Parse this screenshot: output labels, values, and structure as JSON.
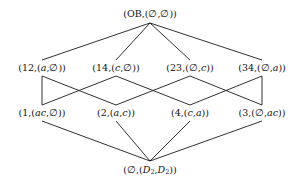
{
  "figure": {
    "type": "hasse-diagram",
    "title": "",
    "background_color": "#ffffff",
    "edge_color": "#1a1a1a",
    "text_color": "#111111",
    "width": 296,
    "height": 184
  },
  "nodes": [
    {
      "id": "top",
      "label": "(OB,(∅,∅))",
      "rank": 0,
      "x": 150,
      "y": 14
    },
    {
      "id": "n12",
      "label": "(12,(a,∅))",
      "rank": 1,
      "x": 42,
      "y": 68
    },
    {
      "id": "n14",
      "label": "(14,(c,∅))",
      "rank": 1,
      "x": 116,
      "y": 68
    },
    {
      "id": "n23",
      "label": "(23,(∅,c))",
      "rank": 1,
      "x": 190,
      "y": 68
    },
    {
      "id": "n34",
      "label": "(34,(∅,a))",
      "rank": 1,
      "x": 262,
      "y": 68
    },
    {
      "id": "n1",
      "label": "(1,(ac,∅))",
      "rank": 2,
      "x": 42,
      "y": 113
    },
    {
      "id": "n2",
      "label": "(2,(a,c))",
      "rank": 2,
      "x": 116,
      "y": 113
    },
    {
      "id": "n4",
      "label": "(4,(c,a))",
      "rank": 2,
      "x": 190,
      "y": 113
    },
    {
      "id": "n3",
      "label": "(3,(∅,ac))",
      "rank": 2,
      "x": 262,
      "y": 113
    },
    {
      "id": "bot",
      "label": "(∅,(D₂,D₂))",
      "rank": 3,
      "x": 150,
      "y": 170
    }
  ],
  "edges": [
    {
      "from": "top",
      "to": "n12"
    },
    {
      "from": "top",
      "to": "n14"
    },
    {
      "from": "top",
      "to": "n23"
    },
    {
      "from": "top",
      "to": "n34"
    },
    {
      "from": "n12",
      "to": "n1"
    },
    {
      "from": "n12",
      "to": "n2"
    },
    {
      "from": "n14",
      "to": "n1"
    },
    {
      "from": "n14",
      "to": "n4"
    },
    {
      "from": "n23",
      "to": "n2"
    },
    {
      "from": "n23",
      "to": "n3"
    },
    {
      "from": "n34",
      "to": "n4"
    },
    {
      "from": "n34",
      "to": "n3"
    },
    {
      "from": "n1",
      "to": "bot"
    },
    {
      "from": "n2",
      "to": "bot"
    },
    {
      "from": "n4",
      "to": "bot"
    },
    {
      "from": "n3",
      "to": "bot"
    }
  ],
  "labels": {
    "top": "(OB,(∅,∅))",
    "n12": "(12,(a,∅))",
    "n14": "(14,(c,∅))",
    "n23": "(23,(∅,c))",
    "n34": "(34,(∅,a))",
    "n1": "(1,(ac,∅))",
    "n2": "(2,(a,c))",
    "n4": "(4,(c,a))",
    "n3": "(3,(∅,ac))",
    "bot": "(∅,(D₂,D₂))"
  }
}
